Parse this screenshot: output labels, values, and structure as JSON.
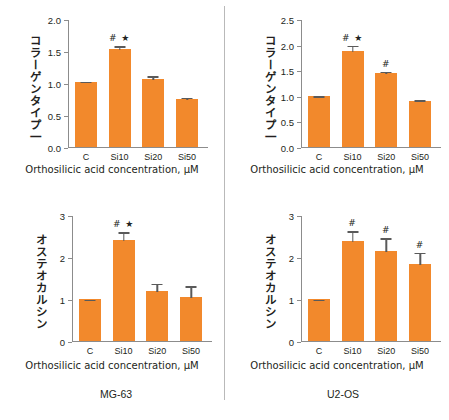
{
  "figure": {
    "divider_color": "#b9b9b9",
    "bar_color": "#f2892c",
    "axis_color": "#8c8c8c",
    "error_color": "#5a5a5a"
  },
  "cell_lines": {
    "left_label": "MG-63",
    "right_label": "U2-OS"
  },
  "chart_data": [
    {
      "id": "mg63-collagen",
      "type": "bar",
      "title": "",
      "ylabel": "コラーゲンタイプ一",
      "xlabel": "Orthosilicic acid concentration, µM",
      "categories": [
        "C",
        "Si10",
        "Si20",
        "Si50"
      ],
      "values": [
        1.01,
        1.53,
        1.06,
        0.75
      ],
      "errors": [
        0.02,
        0.06,
        0.06,
        0.03
      ],
      "annotations": [
        "",
        "# ★",
        "",
        ""
      ],
      "ylim": [
        0.0,
        2.0
      ],
      "yticks": [
        "0.0",
        "0.5",
        "1.0",
        "1.5",
        "2.0"
      ],
      "ytickvals": [
        0.0,
        0.5,
        1.0,
        1.5,
        2.0
      ],
      "grid": false,
      "legend": "none"
    },
    {
      "id": "u2os-collagen",
      "type": "bar",
      "title": "",
      "ylabel": "コラーゲンタイプ一",
      "xlabel": "Orthosilicic acid concentration, µM",
      "categories": [
        "C",
        "Si10",
        "Si20",
        "Si50"
      ],
      "values": [
        1.0,
        1.87,
        1.45,
        0.9
      ],
      "errors": [
        0.01,
        0.13,
        0.04,
        0.03
      ],
      "annotations": [
        "",
        "# ★",
        "#",
        ""
      ],
      "ylim": [
        0.0,
        2.5
      ],
      "yticks": [
        "0.0",
        "0.5",
        "1.0",
        "1.5",
        "2.0",
        "2.5"
      ],
      "ytickvals": [
        0.0,
        0.5,
        1.0,
        1.5,
        2.0,
        2.5
      ],
      "grid": false,
      "legend": "none"
    },
    {
      "id": "mg63-osteocalcin",
      "type": "bar",
      "title": "",
      "ylabel": "オステオカルシン",
      "xlabel": "Orthosilicic acid concentration, µM",
      "categories": [
        "C",
        "Si10",
        "Si20",
        "Si50"
      ],
      "values": [
        1.0,
        2.4,
        1.2,
        1.05
      ],
      "errors": [
        0.01,
        0.21,
        0.18,
        0.28
      ],
      "annotations": [
        "",
        "# ★",
        "",
        ""
      ],
      "ylim": [
        0,
        3
      ],
      "yticks": [
        "0",
        "1",
        "2",
        "3"
      ],
      "ytickvals": [
        0,
        1,
        2,
        3
      ],
      "grid": false,
      "legend": "none"
    },
    {
      "id": "u2os-osteocalcin",
      "type": "bar",
      "title": "",
      "ylabel": "オステオカルシン",
      "xlabel": "Orthosilicic acid concentration, µM",
      "categories": [
        "C",
        "Si10",
        "Si20",
        "Si50"
      ],
      "values": [
        1.0,
        2.38,
        2.15,
        1.83
      ],
      "errors": [
        0.01,
        0.26,
        0.32,
        0.3
      ],
      "annotations": [
        "",
        "#",
        "#",
        "#"
      ],
      "ylim": [
        0,
        3
      ],
      "yticks": [
        "0",
        "1",
        "2",
        "3"
      ],
      "ytickvals": [
        0,
        1,
        2,
        3
      ],
      "grid": false,
      "legend": "none"
    }
  ]
}
